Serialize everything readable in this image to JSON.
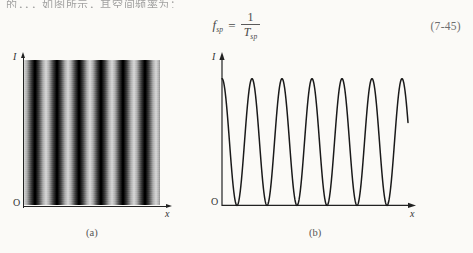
{
  "page": {
    "background_color": "#fbfaf7",
    "ink_color": "#222222",
    "top_text_fragment": "的，，，如图所示，其空间频率为："
  },
  "equation": {
    "lhs_symbol": "f",
    "lhs_subscript": "sp",
    "relation": "=",
    "numerator": "1",
    "denominator_symbol": "T",
    "denominator_subscript": "sp",
    "number": "(7-45)"
  },
  "figure_a": {
    "caption": "(a)",
    "y_axis_label": "I",
    "x_axis_label": "x",
    "origin_label": "O",
    "description": "grayscale sinusoidal fringe pattern",
    "fringe_count": 7,
    "dark_color": "#000000",
    "light_color": "#d9d9d9"
  },
  "figure_b": {
    "caption": "(b)",
    "y_axis_label": "I",
    "x_axis_label": "x",
    "origin_label": "O",
    "description": "raised cosine-squared intensity profile"
  },
  "chart_data": {
    "type": "line",
    "title": "",
    "xlabel": "x",
    "ylabel": "I",
    "xlim": [
      0,
      6.2
    ],
    "ylim": [
      0,
      1.1
    ],
    "grid": false,
    "legend": "none",
    "series": [
      {
        "name": "I(x) = cos^2(pi x / T_sp)",
        "period": 1.0,
        "cycles": 6,
        "amplitude": 1.0,
        "minimum": 0.0,
        "peak_values": [
          1,
          1,
          1,
          1,
          1,
          1
        ],
        "peak_positions": [
          0.5,
          1.5,
          2.5,
          3.5,
          4.5,
          5.5
        ],
        "trough_positions": [
          0,
          1,
          2,
          3,
          4,
          5,
          6
        ],
        "trough_values": [
          0,
          0,
          0,
          0,
          0,
          0,
          0
        ]
      }
    ]
  }
}
